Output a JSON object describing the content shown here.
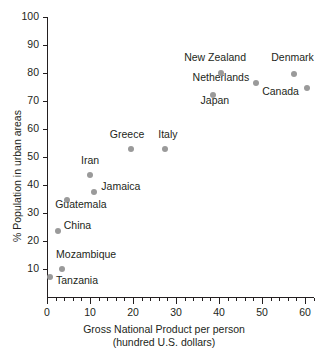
{
  "chart_data": {
    "type": "scatter",
    "title": "",
    "xlabel": "Gross National Product per person",
    "xlabel_line2": "(hundred U.S. dollars)",
    "ylabel": "% Population in urban areas",
    "xlim": [
      0,
      62
    ],
    "ylim": [
      0,
      100
    ],
    "grid": false,
    "legend": "none",
    "x_ticks": [
      0,
      10,
      20,
      30,
      40,
      50,
      60
    ],
    "x_tick_labels": [
      "0",
      "10",
      "20",
      "30",
      "40",
      "50",
      "60"
    ],
    "x_minor_step": 2,
    "y_ticks": [
      10,
      20,
      30,
      40,
      50,
      60,
      70,
      80,
      90,
      100
    ],
    "y_tick_labels": [
      "10",
      "20",
      "30",
      "40",
      "50",
      "60",
      "70",
      "80",
      "90",
      "100"
    ],
    "point_color": "#9a9a9a",
    "axis_color": "#231f20",
    "points": [
      {
        "label": "Tanzania",
        "x": 0.7,
        "y": 7,
        "label_dx": 6,
        "label_dy": 4
      },
      {
        "label": "Mozambique",
        "x": 3.5,
        "y": 10,
        "label_dx": -6,
        "label_dy": -14
      },
      {
        "label": "China",
        "x": 2.5,
        "y": 23.5,
        "label_dx": 6,
        "label_dy": -5
      },
      {
        "label": "Guatemala",
        "x": 4.7,
        "y": 34.5,
        "label_dx": -12,
        "label_dy": 5
      },
      {
        "label": "Jamaica",
        "x": 11,
        "y": 37.5,
        "label_dx": 7,
        "label_dy": -5
      },
      {
        "label": "Iran",
        "x": 10,
        "y": 43.5,
        "label_dx": -9,
        "label_dy": -14
      },
      {
        "label": "Greece",
        "x": 19.5,
        "y": 53,
        "label_dx": -21,
        "label_dy": -14
      },
      {
        "label": "Italy",
        "x": 27.5,
        "y": 53,
        "label_dx": -7,
        "label_dy": -14
      },
      {
        "label": "Japan",
        "x": 38.5,
        "y": 72,
        "label_dx": -12,
        "label_dy": 6
      },
      {
        "label": "Netherlands",
        "x": 48.5,
        "y": 76.5,
        "label_dx": -63,
        "label_dy": -5
      },
      {
        "label": "New Zealand",
        "x": 40.5,
        "y": 80,
        "label_dx": -37,
        "label_dy": -15
      },
      {
        "label": "Denmark",
        "x": 57.5,
        "y": 79.5,
        "label_dx": -23,
        "label_dy": -16
      },
      {
        "label": "Canada",
        "x": 60.5,
        "y": 74.5,
        "label_dx": -45,
        "label_dy": 4
      }
    ]
  }
}
